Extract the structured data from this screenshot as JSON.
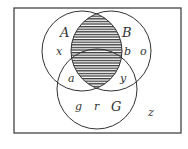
{
  "diagram": {
    "type": "venn",
    "universe": {
      "x": 14,
      "y": 8,
      "w": 167,
      "h": 125,
      "stroke": "#444444"
    },
    "sets": [
      {
        "name": "A",
        "cx": 82,
        "cy": 51,
        "r": 40,
        "label_pos": [
          64,
          36
        ]
      },
      {
        "name": "B",
        "cx": 111,
        "cy": 51,
        "r": 40,
        "label_pos": [
          126,
          36
        ]
      },
      {
        "name": "G",
        "cx": 97,
        "cy": 89,
        "r": 40,
        "label_pos": [
          114,
          110
        ]
      }
    ],
    "shaded_region": "A ∩ B",
    "shading": {
      "pattern": "horizontal-lines",
      "color": "#333333",
      "spacing": 2.6
    },
    "labels": {
      "A": "A",
      "B": "B",
      "G": "G"
    },
    "elements": [
      {
        "text": "x",
        "x": 56,
        "y": 55,
        "region": "A only"
      },
      {
        "text": "b",
        "x": 124,
        "y": 55,
        "region": "B only"
      },
      {
        "text": "o",
        "x": 140,
        "y": 55,
        "region": "B only"
      },
      {
        "text": "a",
        "x": 68,
        "y": 82,
        "region": "A ∩ G"
      },
      {
        "text": "y",
        "x": 120,
        "y": 82,
        "region": "B ∩ G"
      },
      {
        "text": "g",
        "x": 75,
        "y": 110,
        "region": "G only"
      },
      {
        "text": "r",
        "x": 94,
        "y": 110,
        "region": "G only"
      },
      {
        "text": "z",
        "x": 148,
        "y": 116,
        "region": "outside"
      }
    ]
  }
}
